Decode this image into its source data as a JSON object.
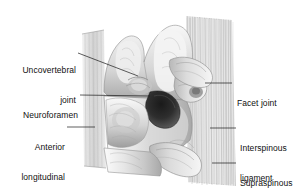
{
  "figure": {
    "background_color": "#ffffff",
    "ink_color": "#101010",
    "style": "grayscale pencil medical illustration",
    "width": 304,
    "height": 194
  },
  "labels": {
    "uncovertebral_joint_line1": "Uncovertebral",
    "uncovertebral_joint_line2": "joint",
    "neuroforamen": "Neuroforamen",
    "anterior_longitudinal_line1": "Anterior",
    "anterior_longitudinal_line2": "longitudinal",
    "anterior_longitudinal_line3": "ligament",
    "facet_joint": "Facet joint",
    "interspinous_line1": "Interspinous",
    "interspinous_line2": "ligament",
    "supraspinous_line1": "Supraspinous",
    "supraspinous_line2": "ligament"
  },
  "anatomy": {
    "structures": [
      "uncinate process",
      "vertebral body",
      "intervertebral disc",
      "neural foramen",
      "facet joint",
      "spinous process",
      "anterior longitudinal ligament",
      "interspinous ligament",
      "supraspinous ligament"
    ]
  }
}
